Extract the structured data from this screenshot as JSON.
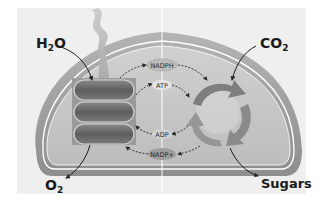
{
  "diagram": {
    "colors": {
      "background_panel": "#efefef",
      "outer_membrane": "#9a9a9a",
      "inner_membrane_line": "#ffffff",
      "stroma": "#c6c6c6",
      "thylakoid": "#6f6f6f",
      "cycle_arrow": "#8c8c8c",
      "text": "#1a1a1a"
    },
    "labels": {
      "input_water": {
        "base": "H",
        "sub": "2",
        "tail": "O"
      },
      "input_co2": {
        "base": "CO",
        "sub": "2"
      },
      "output_o2": {
        "base": "O",
        "sub": "2"
      },
      "output_sugars": "Sugars"
    },
    "carriers": {
      "nadph": "NADPH",
      "atp": "ATP",
      "adp": "ADP",
      "nadp_plus": "NADP+"
    },
    "structures": {
      "light_beam": "light",
      "thylakoid_stack": "thylakoid stack (3 discs)",
      "calvin_cycle": "Calvin cycle (3 arrows)"
    }
  }
}
